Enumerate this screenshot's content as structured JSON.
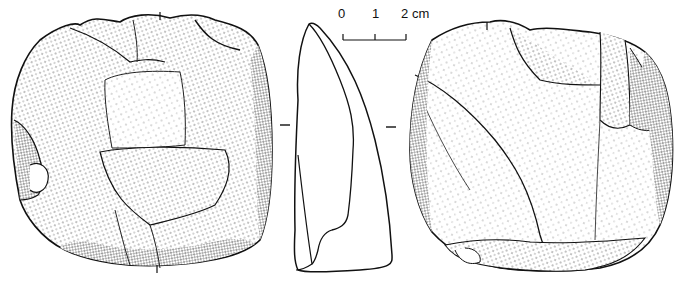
{
  "figure": {
    "views": [
      {
        "id": "front",
        "label": "front-face"
      },
      {
        "id": "profile",
        "label": "side-profile"
      },
      {
        "id": "reverse",
        "label": "reverse-face"
      }
    ],
    "scale_bar": {
      "ticks": [
        "0",
        "1",
        "2"
      ],
      "unit": "cm",
      "tick_2_with_unit": "2 cm"
    },
    "colors": {
      "ink": "#111111",
      "paper": "#ffffff"
    }
  }
}
